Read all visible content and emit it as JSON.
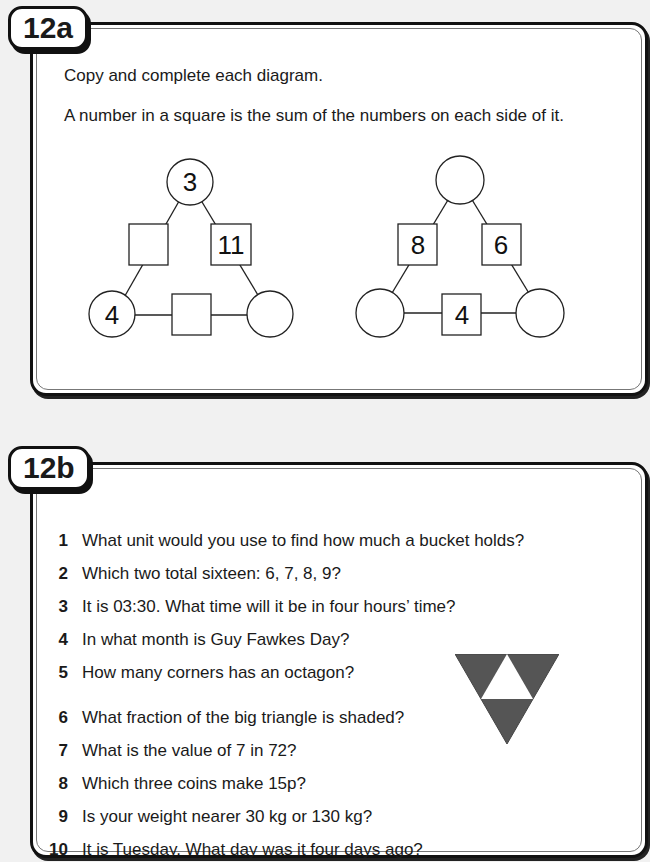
{
  "section_a": {
    "tag": "12a",
    "instruction_1": "Copy and complete each diagram.",
    "instruction_2": "A number in a square is the sum of the numbers on each side of it.",
    "diagrams": [
      {
        "top_circle": "3",
        "left_square": "",
        "right_square": "11",
        "bottom_left_circle": "4",
        "bottom_square": "",
        "bottom_right_circle": ""
      },
      {
        "top_circle": "",
        "left_square": "8",
        "right_square": "6",
        "bottom_left_circle": "",
        "bottom_square": "4",
        "bottom_right_circle": ""
      }
    ]
  },
  "section_b": {
    "tag": "12b",
    "questions": [
      {
        "num": "1",
        "text": "What unit would you use to find how much a bucket holds?"
      },
      {
        "num": "2",
        "text": "Which two total sixteen: 6, 7, 8, 9?"
      },
      {
        "num": "3",
        "text": "It is 03:30.  What time will it be in four hours’ time?"
      },
      {
        "num": "4",
        "text": "In what month is Guy Fawkes Day?"
      },
      {
        "num": "5",
        "text": "How many corners has an octagon?"
      },
      {
        "num": "6",
        "text": "What fraction of the big triangle is shaded?"
      },
      {
        "num": "7",
        "text": "What is the value of 7 in 72?"
      },
      {
        "num": "8",
        "text": "Which three coins make 15p?"
      },
      {
        "num": "9",
        "text": "Is your weight nearer 30 kg or 130 kg?"
      },
      {
        "num": "10",
        "text": "It is Tuesday.  What day was it four days ago?"
      }
    ],
    "triangle_colors": {
      "shaded": "#555555",
      "unshaded": "#ffffff"
    }
  }
}
